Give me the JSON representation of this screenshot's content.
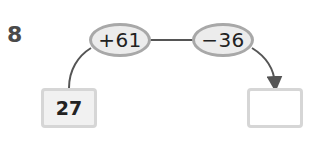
{
  "problem": {
    "number": "8"
  },
  "operations": [
    {
      "label": "+61"
    },
    {
      "label": "−36"
    }
  ],
  "start_box": {
    "value": "27"
  },
  "answer_box": {
    "value": ""
  },
  "colors": {
    "oval_fill": "#ececec",
    "oval_border": "#a8a8a8",
    "box_border": "#d6d6d6",
    "line": "#555555"
  }
}
